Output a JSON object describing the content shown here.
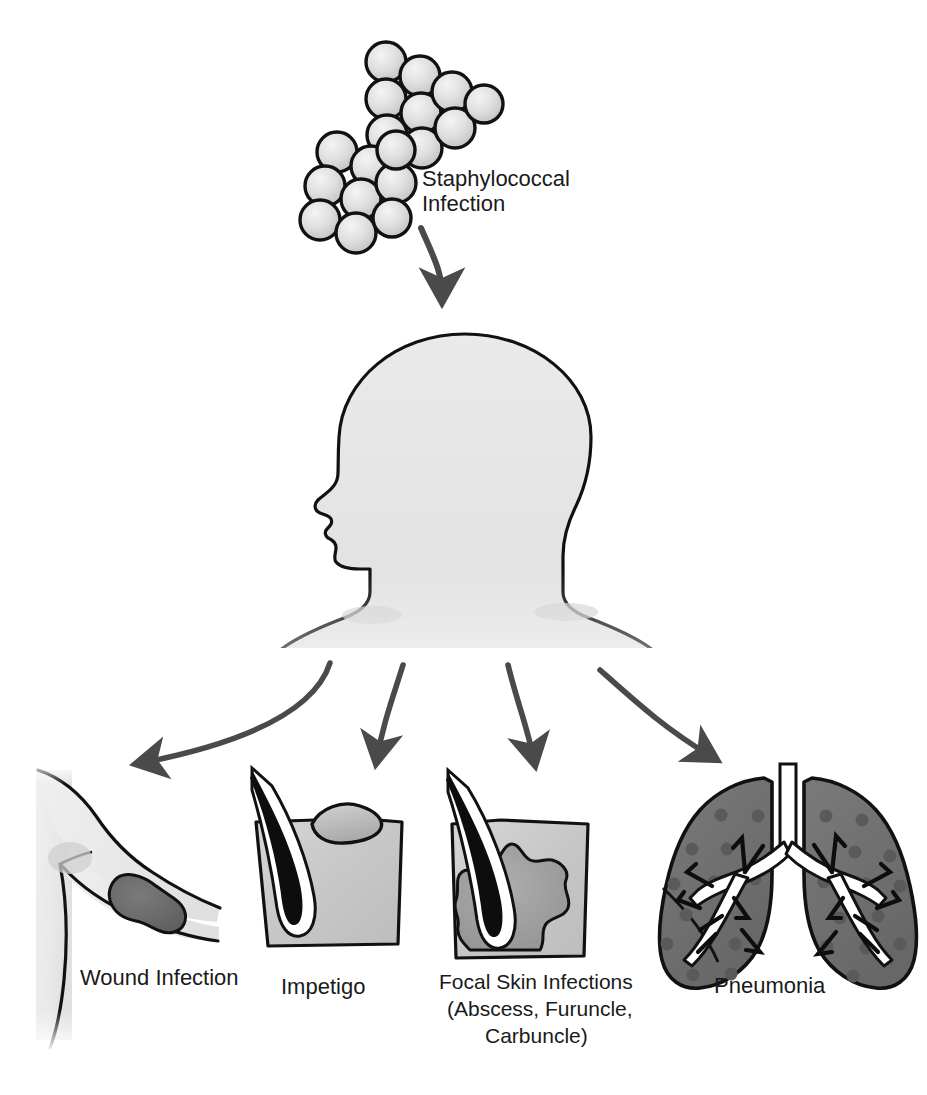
{
  "diagram": {
    "title_label": "Staphylococcal Infection",
    "source": {
      "name": "staphylococcus-cluster",
      "label_line1": "Staphylococcal",
      "label_line2": "Infection",
      "coccus_fill": "#d9d9d9",
      "coccus_stroke": "#111111"
    },
    "host": {
      "name": "human-head-bust-silhouette",
      "fill": "#e3e3e3",
      "stroke": "#111111"
    },
    "arrows": {
      "color": "#4a4a4a",
      "top_arrow_name": "arrow-infection-to-host",
      "fan": [
        "arrow-to-wound-infection",
        "arrow-to-impetigo",
        "arrow-to-focal-skin-infections",
        "arrow-to-pneumonia"
      ]
    },
    "outcomes": [
      {
        "id": "wound-infection",
        "label_lines": [
          "Wound Infection"
        ],
        "skin_fill": "#ededed",
        "lesion_fill": "#6d6d6d"
      },
      {
        "id": "impetigo",
        "label_lines": [
          "Impetigo"
        ],
        "skin_fill": "#c9c9c9",
        "bulla_fill": "#bdbdbd",
        "hair_fill": "#0d0d0d"
      },
      {
        "id": "focal-skin-infections",
        "label_lines": [
          "Focal Skin Infections",
          "(Abscess, Furuncle,",
          "Carbuncle)"
        ],
        "skin_fill": "#c9c9c9",
        "abscess_fill": "#9d9d9d",
        "hair_fill": "#0d0d0d"
      },
      {
        "id": "pneumonia",
        "label_lines": [
          "Pneumonia"
        ],
        "lung_fill": "#6f6f6f",
        "infiltrate_fill": "#5a5a5a",
        "bronchi_fill": "#ffffff"
      }
    ]
  }
}
